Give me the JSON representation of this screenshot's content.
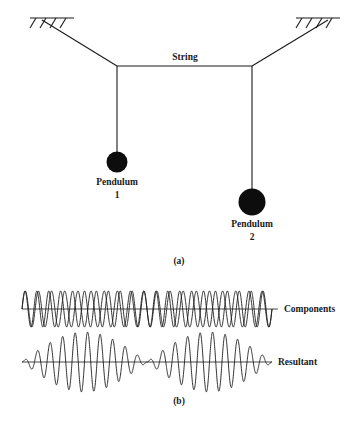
{
  "figure": {
    "panels": [
      {
        "id": "a",
        "caption": "(a)",
        "type": "coupled-pendulum-diagram",
        "labels": {
          "string": "String",
          "pendulum1_line1": "Pendulum",
          "pendulum1_line2": "1",
          "pendulum2_line1": "Pendulum",
          "pendulum2_line2": "2"
        },
        "geometry": {
          "support_left": {
            "x1": 30,
            "x2": 74,
            "y": 18,
            "hatch_count": 4
          },
          "support_right": {
            "x1": 296,
            "x2": 340,
            "y": 18,
            "hatch_count": 4
          },
          "junction_left": {
            "x": 117,
            "y": 66
          },
          "junction_right": {
            "x": 252,
            "y": 66
          },
          "bob1": {
            "cx": 117,
            "cy": 162,
            "r": 10.5
          },
          "bob2": {
            "cx": 252,
            "cy": 202,
            "r": 13.5
          }
        },
        "colors": {
          "stroke": "#1a1a1a",
          "bob_fill": "#0d0d0d"
        }
      },
      {
        "id": "b",
        "caption": "(b)",
        "type": "beat-waveforms",
        "labels": {
          "components": "Components",
          "resultant": "Resultant"
        },
        "geometry": {
          "components_baseline_y": 309,
          "resultant_baseline_y": 362,
          "wave_x_start": 22,
          "wave_x_end": 272
        }
      }
    ]
  },
  "chart_data": {
    "type": "line",
    "title": "",
    "xlabel": "",
    "ylabel": "",
    "grid": false,
    "legend_position": "right",
    "panels": [
      {
        "name": "Components",
        "description": "Two superposed sinusoids of slightly different frequency producing a phase drift (beats).",
        "baseline_y": 309,
        "x_range": [
          22,
          272
        ],
        "amplitude": 18,
        "series": [
          {
            "name": "component-1",
            "cycles": 19.0,
            "amplitude": 18,
            "phase_deg": 0
          },
          {
            "name": "component-2",
            "cycles": 21.0,
            "amplitude": 18,
            "phase_deg": 0
          }
        ]
      },
      {
        "name": "Resultant",
        "description": "Sum of the two components: carrier at the mean frequency modulated by a beat envelope with nodes at the start, middle and end.",
        "baseline_y": 362,
        "x_range": [
          22,
          272
        ],
        "amplitude": 30,
        "series": [
          {
            "name": "resultant",
            "carrier_cycles": 20.0,
            "envelope_cycles": 1.0,
            "amplitude": 30,
            "beat_nodes": [
              22,
              147,
              272
            ],
            "beat_antinodes": [
              84,
              210
            ]
          }
        ]
      }
    ]
  }
}
